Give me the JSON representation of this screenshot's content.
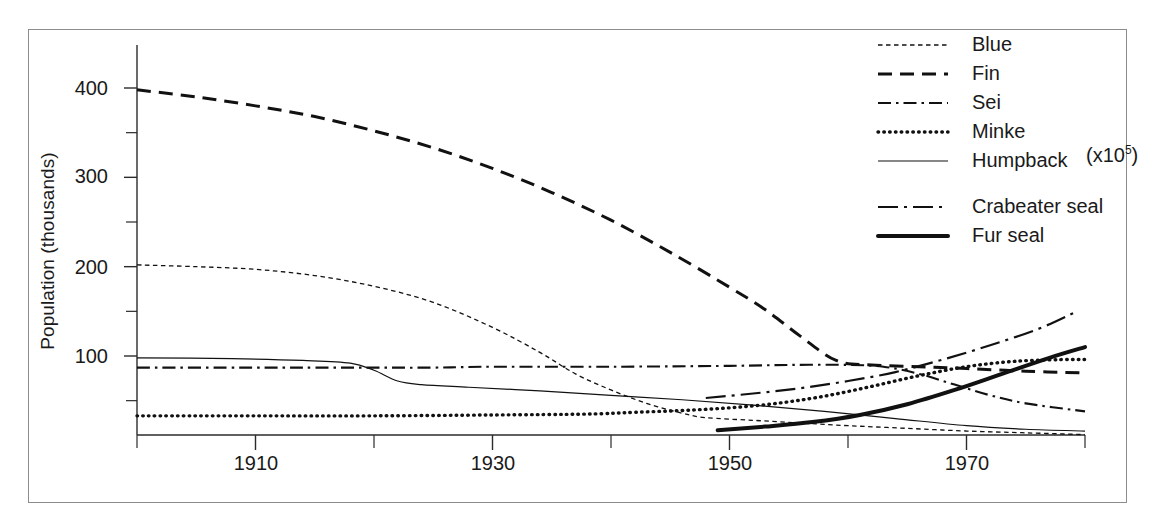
{
  "chart_data": {
    "type": "line",
    "title": "",
    "subtitle": "",
    "xlabel": "",
    "ylabel": "Population (thousands)",
    "xlim": [
      1900,
      1980
    ],
    "ylim": [
      11,
      448
    ],
    "xticks_major": [
      1910,
      1930,
      1950,
      1970
    ],
    "xticks_minor": [
      1900,
      1920,
      1940,
      1960,
      1980
    ],
    "xtick_labels": [
      "1910",
      "1930",
      "1950",
      "1970"
    ],
    "yticks_major": [
      100,
      200,
      300,
      400
    ],
    "yticks_minor": [
      50,
      150,
      250,
      350
    ],
    "ytick_labels": [
      "100",
      "200",
      "300",
      "400"
    ],
    "grid": false,
    "legend_position": "top-right",
    "annotations": [
      {
        "text": "(x10⁵)",
        "x": 1980,
        "y": 155,
        "refers_to": "Crabeater seal"
      }
    ],
    "series": [
      {
        "name": "Blue",
        "label": "Blue",
        "style": "fine-dotted",
        "color": "#111111",
        "x": [
          1900,
          1905,
          1910,
          1915,
          1920,
          1925,
          1930,
          1934,
          1937,
          1940,
          1943,
          1946,
          1948,
          1952,
          1956,
          1960,
          1965,
          1970,
          1975,
          1980
        ],
        "y": [
          202,
          200,
          197,
          190,
          178,
          160,
          132,
          104,
          80,
          62,
          47,
          36,
          31,
          28,
          25,
          22,
          19,
          16,
          14,
          12
        ]
      },
      {
        "name": "Fin",
        "label": "Fin",
        "style": "long-dashed",
        "color": "#111111",
        "x": [
          1900,
          1905,
          1910,
          1915,
          1920,
          1925,
          1930,
          1935,
          1940,
          1945,
          1950,
          1953,
          1956,
          1959,
          1962,
          1966,
          1970,
          1975,
          1980
        ],
        "y": [
          398,
          390,
          380,
          368,
          352,
          333,
          310,
          283,
          252,
          216,
          177,
          152,
          122,
          95,
          90,
          88,
          86,
          83,
          81
        ]
      },
      {
        "name": "Sei",
        "label": "Sei",
        "style": "dash-dot",
        "color": "#111111",
        "x": [
          1900,
          1910,
          1915,
          1920,
          1925,
          1930,
          1940,
          1950,
          1955,
          1960,
          1963,
          1966,
          1969,
          1972,
          1975,
          1980
        ],
        "y": [
          87,
          87,
          87,
          87,
          87,
          88,
          88,
          89,
          90,
          90,
          88,
          80,
          68,
          56,
          47,
          38
        ]
      },
      {
        "name": "Minke",
        "label": "Minke",
        "style": "dotted",
        "color": "#111111",
        "x": [
          1900,
          1910,
          1920,
          1930,
          1938,
          1942,
          1946,
          1950,
          1954,
          1958,
          1962,
          1966,
          1970,
          1974,
          1978,
          1980
        ],
        "y": [
          33,
          33,
          33,
          34,
          35,
          37,
          39,
          42,
          47,
          55,
          66,
          78,
          88,
          94,
          96,
          96
        ]
      },
      {
        "name": "Humpback",
        "label": "Humpback",
        "style": "thin-solid",
        "color": "#111111",
        "x": [
          1900,
          1908,
          1914,
          1918,
          1920,
          1922,
          1924,
          1928,
          1934,
          1940,
          1946,
          1952,
          1958,
          1964,
          1970,
          1975,
          1980
        ],
        "y": [
          98,
          97,
          95,
          92,
          84,
          72,
          68,
          65,
          61,
          56,
          51,
          45,
          38,
          30,
          22,
          18,
          16
        ]
      },
      {
        "name": "Crabeater seal",
        "label": "Crabeater seal",
        "style": "long-dash-dot",
        "color": "#111111",
        "x": [
          1948,
          1952,
          1956,
          1960,
          1964,
          1968,
          1972,
          1976,
          1979
        ],
        "y": [
          53,
          58,
          64,
          72,
          82,
          96,
          112,
          130,
          148
        ]
      },
      {
        "name": "Fur seal",
        "label": "Fur seal",
        "style": "thick-solid",
        "color": "#111111",
        "x": [
          1949,
          1953,
          1957,
          1961,
          1965,
          1969,
          1973,
          1977,
          1980
        ],
        "y": [
          17,
          21,
          26,
          34,
          46,
          62,
          80,
          98,
          110
        ]
      }
    ]
  },
  "axes": {
    "y_title": "Population (thousands)",
    "y_tick_labels": [
      "400",
      "300",
      "200",
      "100"
    ],
    "x_tick_labels": [
      "1910",
      "1930",
      "1950",
      "1970"
    ]
  },
  "legend": {
    "items": [
      {
        "label": "Blue",
        "style": "fine-dotted"
      },
      {
        "label": "Fin",
        "style": "long-dashed"
      },
      {
        "label": "Sei",
        "style": "dash-dot"
      },
      {
        "label": "Minke",
        "style": "dotted"
      },
      {
        "label": "Humpback",
        "style": "thin-solid"
      },
      {
        "label": "Crabeater seal",
        "style": "long-dash-dot"
      },
      {
        "label": "Fur seal",
        "style": "thick-solid"
      }
    ]
  },
  "annotation": {
    "text": "(x10",
    "exponent": "5",
    "suffix": ")"
  }
}
